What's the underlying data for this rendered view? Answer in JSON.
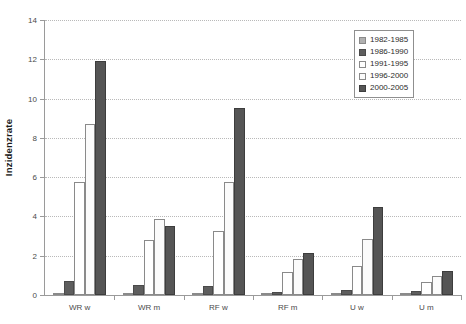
{
  "chart_data": {
    "type": "bar",
    "title": "",
    "xlabel": "",
    "ylabel": "Inzidenzrate",
    "ylim": [
      0,
      14
    ],
    "ytick_step": 2,
    "ytick_labels": [
      "0",
      "2",
      "4",
      "6",
      "8",
      "10",
      "12",
      "14"
    ],
    "grid": true,
    "legend_position": "top-right",
    "categories": [
      "WR w",
      "WR m",
      "RF w",
      "RF m",
      "U w",
      "U m"
    ],
    "series": [
      {
        "name": "1982-1985",
        "color": "#b0b0b0",
        "values": [
          0.05,
          0.05,
          0.1,
          0.05,
          0.1,
          0.02
        ]
      },
      {
        "name": "1986-1990",
        "color": "#5e5e5e",
        "values": [
          0.7,
          0.5,
          0.45,
          0.15,
          0.25,
          0.2
        ]
      },
      {
        "name": "1991-1995",
        "color": "#ffffff",
        "values": [
          5.75,
          2.8,
          3.25,
          1.15,
          1.5,
          0.65
        ]
      },
      {
        "name": "1996-2000",
        "color": "#fbfbfb",
        "values": [
          8.7,
          3.85,
          5.75,
          1.85,
          2.85,
          0.95
        ]
      },
      {
        "name": "2000-2005",
        "color": "#555555",
        "values": [
          11.9,
          3.5,
          9.5,
          2.15,
          4.5,
          1.2
        ]
      }
    ]
  },
  "legend": {
    "items": [
      {
        "label": "1982-1985"
      },
      {
        "label": "1986-1990"
      },
      {
        "label": "1991-1995"
      },
      {
        "label": "1996-2000"
      },
      {
        "label": "2000-2005"
      }
    ]
  }
}
